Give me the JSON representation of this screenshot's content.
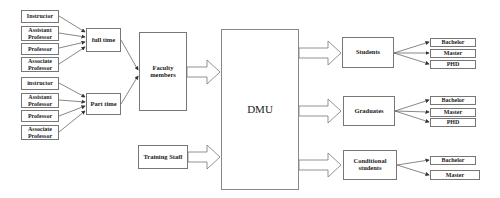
{
  "diagram": {
    "staff_types_full_time": [
      {
        "label": "Instructor"
      },
      {
        "label": "Assistant Professor"
      },
      {
        "label": "Professor"
      },
      {
        "label": "Associate Professor"
      }
    ],
    "staff_types_part_time": [
      {
        "label": "instructor"
      },
      {
        "label": "Assistant Professor"
      },
      {
        "label": "Professor"
      },
      {
        "label": "Associate Professor"
      }
    ],
    "full_time": "full time",
    "part_time": "Part time",
    "faculty_members": "Faculty members",
    "training_staff": "Training Staff",
    "center": "DMU",
    "outputs": [
      {
        "label": "Students",
        "levels": [
          "Bachelor",
          "Master",
          "PHD"
        ]
      },
      {
        "label": "Graduates",
        "levels": [
          "Bachelor",
          "Master",
          "PHD"
        ]
      },
      {
        "label": "Conditional students",
        "levels": [
          "Bachelor",
          "Master"
        ]
      }
    ]
  }
}
